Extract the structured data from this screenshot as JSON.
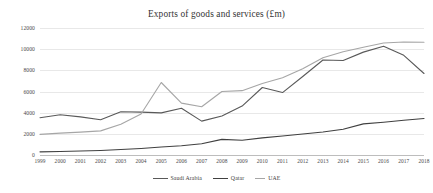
{
  "header": {
    "ghost_text": ""
  },
  "chart_data": {
    "type": "line",
    "title": "Exports of goods and services (£m)",
    "xlabel": "",
    "ylabel": "",
    "ylim": [
      0,
      12000
    ],
    "ytick_step": 2000,
    "yticks": [
      "0",
      "2000",
      "4000",
      "6000",
      "8000",
      "10000",
      "12000"
    ],
    "grid": true,
    "legend_position": "bottom",
    "categories": [
      "1999",
      "2000",
      "2001",
      "2002",
      "2003",
      "2004",
      "2005",
      "2006",
      "2007",
      "2008",
      "2009",
      "2010",
      "2011",
      "2012",
      "2013",
      "2014",
      "2015",
      "2016",
      "2017",
      "2018"
    ],
    "series": [
      {
        "name": "Saudi Arabia",
        "color": "#595959",
        "values": [
          3520,
          3800,
          3600,
          3330,
          4080,
          4050,
          3980,
          4420,
          3200,
          3680,
          4620,
          6380,
          5900,
          7420,
          8980,
          8930,
          9720,
          10280,
          9420,
          7700
        ]
      },
      {
        "name": "Qatar",
        "color": "#404040",
        "values": [
          300,
          330,
          380,
          430,
          520,
          620,
          760,
          880,
          1060,
          1480,
          1400,
          1620,
          1800,
          1980,
          2180,
          2440,
          2940,
          3100,
          3280,
          3450
        ]
      },
      {
        "name": "UAE",
        "color": "#a6a6a6",
        "values": [
          1950,
          2070,
          2160,
          2280,
          2900,
          3880,
          6850,
          4900,
          4560,
          6000,
          6080,
          6760,
          7300,
          8140,
          9180,
          9760,
          10180,
          10580,
          10680,
          10660
        ]
      }
    ]
  }
}
